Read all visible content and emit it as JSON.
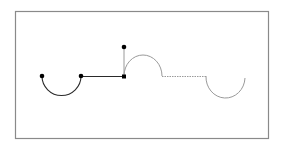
{
  "diagram": {
    "colors": {
      "background": "#ffffff",
      "frame": "#8a8a8a",
      "drawn_path": "#2a2a2a",
      "pending_path": "#9a9a9a",
      "control_point": "#000000"
    },
    "segments": [
      {
        "kind": "arc",
        "style": "drawn",
        "label": "semicircle-down"
      },
      {
        "kind": "line",
        "style": "drawn",
        "label": "horizontal-line"
      },
      {
        "kind": "line",
        "style": "pending",
        "label": "vertical-tangent-line"
      },
      {
        "kind": "arc",
        "style": "pending",
        "label": "semicircle-up"
      },
      {
        "kind": "line",
        "style": "pending-dashed",
        "label": "horizontal-dashed-line"
      },
      {
        "kind": "arc",
        "style": "pending",
        "label": "partial-circle-down"
      }
    ],
    "control_points": 4
  }
}
